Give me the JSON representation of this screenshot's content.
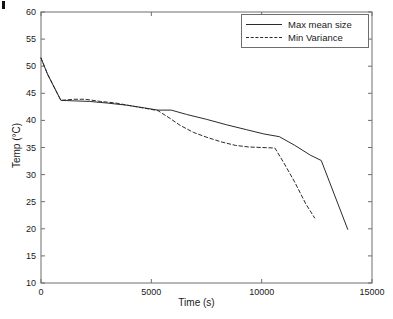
{
  "chart_data": {
    "type": "line",
    "title": "",
    "xlabel": "Time (s)",
    "ylabel": "Temp (°C)",
    "xlim": [
      0,
      15000
    ],
    "ylim": [
      10,
      60
    ],
    "xticks": [
      0,
      5000,
      10000,
      15000
    ],
    "xtick_labels": [
      "0",
      "5000",
      "10000",
      "15000"
    ],
    "yticks": [
      10,
      15,
      20,
      25,
      30,
      35,
      40,
      45,
      50,
      55,
      60
    ],
    "ytick_labels": [
      "10",
      "15",
      "20",
      "25",
      "30",
      "35",
      "40",
      "45",
      "50",
      "55",
      "60"
    ],
    "grid": false,
    "legend_position": "top-right",
    "line_color": "#2b2b2b",
    "axis_color": "#6e6e6e",
    "series": [
      {
        "name": "Max mean size",
        "style": "solid",
        "x": [
          0,
          300,
          900,
          1500,
          2200,
          3000,
          3900,
          4700,
          5300,
          5900,
          6600,
          7500,
          8400,
          9300,
          10100,
          10800,
          11500,
          12200,
          12700,
          13900
        ],
        "y": [
          51.5,
          48.5,
          43.7,
          43.6,
          43.5,
          43.2,
          42.8,
          42.3,
          41.9,
          41.9,
          41.1,
          40.2,
          39.2,
          38.3,
          37.5,
          37.0,
          35.4,
          33.6,
          32.6,
          19.9
        ]
      },
      {
        "name": "Min Variance",
        "style": "dashed",
        "x": [
          0,
          300,
          900,
          1500,
          2000,
          2700,
          3400,
          4200,
          4900,
          5300,
          5800,
          6300,
          6900,
          7500,
          8200,
          8800,
          9400,
          10000,
          10600,
          11000,
          11500,
          12000,
          12400
        ],
        "y": [
          51.5,
          48.5,
          43.7,
          43.9,
          43.9,
          43.5,
          43.2,
          42.6,
          42.1,
          41.8,
          40.5,
          39.1,
          37.8,
          36.9,
          36.0,
          35.4,
          35.1,
          35.0,
          34.9,
          32.2,
          28.6,
          24.6,
          22.0
        ]
      }
    ]
  },
  "legend": {
    "items": [
      {
        "label": "Max mean size",
        "style": "solid"
      },
      {
        "label": "Min Variance",
        "style": "dashed"
      }
    ]
  },
  "axes": {
    "x_title": "Time (s)",
    "y_title": "Temp (°C)"
  }
}
